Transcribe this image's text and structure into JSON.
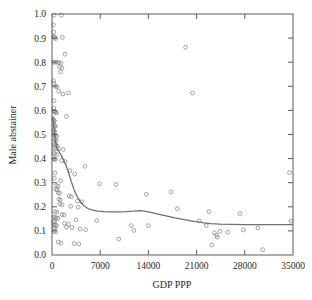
{
  "chart_data": {
    "type": "scatter",
    "title": "",
    "xlabel": "GDP PPP",
    "ylabel": "Male abstainer",
    "xlim": [
      0,
      35000
    ],
    "ylim": [
      0.0,
      1.0
    ],
    "xticks": [
      0,
      7000,
      14000,
      21000,
      28000,
      35000
    ],
    "xticklabels": [
      "0",
      "7000",
      "14000",
      "21000",
      "28000",
      "35000"
    ],
    "yticks": [
      0.0,
      0.1,
      0.2,
      0.3,
      0.4,
      0.5,
      0.6,
      0.7,
      0.8,
      0.9,
      1.0
    ],
    "yticklabels": [
      "0.0",
      "0.1",
      "0.2",
      "0.3",
      "0.4",
      "0.5",
      "0.6",
      "0.7",
      "0.8",
      "0.9",
      "1.0"
    ],
    "grid": false,
    "legend": false,
    "marker": "open-circle",
    "marker_color": "#8c8c8c",
    "trend_color": "#6f6f6f",
    "frame_color": "#5a5a5a",
    "series": [
      {
        "name": "Countries",
        "points": [
          [
            300,
            0.995
          ],
          [
            1350,
            0.995
          ],
          [
            180,
            0.955
          ],
          [
            250,
            0.925
          ],
          [
            200,
            0.905
          ],
          [
            330,
            0.905
          ],
          [
            420,
            0.903
          ],
          [
            1500,
            0.903
          ],
          [
            520,
            0.898
          ],
          [
            19400,
            0.862
          ],
          [
            1900,
            0.833
          ],
          [
            250,
            0.8
          ],
          [
            400,
            0.8
          ],
          [
            700,
            0.8
          ],
          [
            1000,
            0.798
          ],
          [
            1300,
            0.796
          ],
          [
            1100,
            0.78
          ],
          [
            1450,
            0.776
          ],
          [
            1250,
            0.76
          ],
          [
            230,
            0.723
          ],
          [
            250,
            0.712
          ],
          [
            520,
            0.7
          ],
          [
            700,
            0.698
          ],
          [
            980,
            0.68
          ],
          [
            2400,
            0.673
          ],
          [
            20400,
            0.672
          ],
          [
            1600,
            0.668
          ],
          [
            300,
            0.64
          ],
          [
            260,
            0.61
          ],
          [
            230,
            0.598
          ],
          [
            300,
            0.596
          ],
          [
            420,
            0.594
          ],
          [
            560,
            0.592
          ],
          [
            640,
            0.59
          ],
          [
            2100,
            0.575
          ],
          [
            210,
            0.562
          ],
          [
            280,
            0.558
          ],
          [
            350,
            0.556
          ],
          [
            240,
            0.54
          ],
          [
            380,
            0.536
          ],
          [
            480,
            0.534
          ],
          [
            230,
            0.52
          ],
          [
            300,
            0.516
          ],
          [
            400,
            0.512
          ],
          [
            250,
            0.5
          ],
          [
            340,
            0.498
          ],
          [
            520,
            0.496
          ],
          [
            680,
            0.492
          ],
          [
            300,
            0.482
          ],
          [
            450,
            0.478
          ],
          [
            600,
            0.474
          ],
          [
            260,
            0.462
          ],
          [
            410,
            0.458
          ],
          [
            560,
            0.456
          ],
          [
            780,
            0.452
          ],
          [
            300,
            0.445
          ],
          [
            520,
            0.442
          ],
          [
            900,
            0.44
          ],
          [
            1600,
            0.438
          ],
          [
            220,
            0.425
          ],
          [
            400,
            0.42
          ],
          [
            700,
            0.416
          ],
          [
            250,
            0.4
          ],
          [
            330,
            0.398
          ],
          [
            500,
            0.396
          ],
          [
            1400,
            0.392
          ],
          [
            1900,
            0.388
          ],
          [
            4800,
            0.368
          ],
          [
            2600,
            0.35
          ],
          [
            420,
            0.34
          ],
          [
            3300,
            0.336
          ],
          [
            340,
            0.318
          ],
          [
            1250,
            0.308
          ],
          [
            34500,
            0.342
          ],
          [
            6900,
            0.295
          ],
          [
            9300,
            0.292
          ],
          [
            640,
            0.288
          ],
          [
            880,
            0.286
          ],
          [
            17300,
            0.262
          ],
          [
            560,
            0.272
          ],
          [
            760,
            0.27
          ],
          [
            13700,
            0.252
          ],
          [
            880,
            0.258
          ],
          [
            1120,
            0.256
          ],
          [
            2500,
            0.245
          ],
          [
            2800,
            0.242
          ],
          [
            1000,
            0.232
          ],
          [
            1200,
            0.228
          ],
          [
            3700,
            0.224
          ],
          [
            4300,
            0.221
          ],
          [
            1150,
            0.212
          ],
          [
            1450,
            0.208
          ],
          [
            2700,
            0.202
          ],
          [
            3800,
            0.198
          ],
          [
            18200,
            0.192
          ],
          [
            420,
            0.18
          ],
          [
            700,
            0.178
          ],
          [
            27300,
            0.172
          ],
          [
            1450,
            0.168
          ],
          [
            1750,
            0.166
          ],
          [
            22800,
            0.18
          ],
          [
            280,
            0.158
          ],
          [
            460,
            0.156
          ],
          [
            640,
            0.154
          ],
          [
            860,
            0.152
          ],
          [
            3500,
            0.146
          ],
          [
            6500,
            0.143
          ],
          [
            250,
            0.14
          ],
          [
            380,
            0.138
          ],
          [
            21400,
            0.142
          ],
          [
            34700,
            0.14
          ],
          [
            220,
            0.128
          ],
          [
            330,
            0.126
          ],
          [
            480,
            0.124
          ],
          [
            660,
            0.122
          ],
          [
            1800,
            0.132
          ],
          [
            2400,
            0.128
          ],
          [
            11500,
            0.122
          ],
          [
            14000,
            0.122
          ],
          [
            2100,
            0.116
          ],
          [
            2900,
            0.114
          ],
          [
            270,
            0.112
          ],
          [
            430,
            0.11
          ],
          [
            4100,
            0.108
          ],
          [
            4900,
            0.105
          ],
          [
            22400,
            0.122
          ],
          [
            29900,
            0.112
          ],
          [
            27800,
            0.104
          ],
          [
            11900,
            0.102
          ],
          [
            24400,
            0.098
          ],
          [
            25500,
            0.095
          ],
          [
            310,
            0.098
          ],
          [
            520,
            0.096
          ],
          [
            23600,
            0.092
          ],
          [
            23900,
            0.082
          ],
          [
            24000,
            0.074
          ],
          [
            9700,
            0.066
          ],
          [
            900,
            0.054
          ],
          [
            1300,
            0.05
          ],
          [
            3200,
            0.048
          ],
          [
            3900,
            0.046
          ],
          [
            23200,
            0.042
          ],
          [
            30600,
            0.022
          ]
        ]
      }
    ],
    "trend": {
      "name": "smoothed fit",
      "points": [
        [
          120,
          0.575
        ],
        [
          260,
          0.545
        ],
        [
          400,
          0.505
        ],
        [
          520,
          0.47
        ],
        [
          640,
          0.452
        ],
        [
          800,
          0.44
        ],
        [
          1000,
          0.43
        ],
        [
          1250,
          0.418
        ],
        [
          1500,
          0.405
        ],
        [
          1800,
          0.388
        ],
        [
          2100,
          0.366
        ],
        [
          2450,
          0.338
        ],
        [
          2800,
          0.305
        ],
        [
          3200,
          0.272
        ],
        [
          3600,
          0.245
        ],
        [
          4100,
          0.222
        ],
        [
          4600,
          0.205
        ],
        [
          5200,
          0.193
        ],
        [
          5900,
          0.186
        ],
        [
          6700,
          0.182
        ],
        [
          7600,
          0.18
        ],
        [
          8600,
          0.179
        ],
        [
          9700,
          0.179
        ],
        [
          10800,
          0.18
        ],
        [
          11900,
          0.182
        ],
        [
          12700,
          0.184
        ],
        [
          13400,
          0.182
        ],
        [
          14200,
          0.178
        ],
        [
          15200,
          0.171
        ],
        [
          16400,
          0.163
        ],
        [
          17700,
          0.155
        ],
        [
          19200,
          0.147
        ],
        [
          20600,
          0.14
        ],
        [
          21800,
          0.134
        ],
        [
          23000,
          0.13
        ],
        [
          24400,
          0.128
        ],
        [
          26000,
          0.127
        ],
        [
          28000,
          0.126
        ],
        [
          30000,
          0.126
        ],
        [
          32000,
          0.126
        ],
        [
          34900,
          0.126
        ]
      ]
    }
  }
}
